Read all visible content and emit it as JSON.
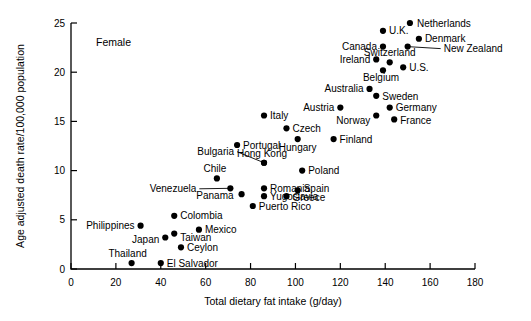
{
  "chart_data": {
    "type": "scatter",
    "title": "",
    "annotation": "Female",
    "xlabel": "Total dietary fat intake (g/day)",
    "ylabel": "Age adjusted death rate/100,000 population",
    "xlim": [
      0,
      180
    ],
    "ylim": [
      0,
      25
    ],
    "xticks": [
      0,
      20,
      40,
      60,
      80,
      100,
      120,
      140,
      160,
      180
    ],
    "yticks": [
      0,
      5,
      10,
      15,
      20,
      25
    ],
    "grid": false,
    "legend": "none",
    "points": [
      {
        "label": "Netherlands",
        "x": 151,
        "y": 25.0,
        "label_dx": 7,
        "label_dy": 3.5,
        "anchor": "start",
        "leader": false
      },
      {
        "label": "U.K.",
        "x": 139,
        "y": 24.2,
        "label_dx": 6,
        "label_dy": 3.5,
        "anchor": "start",
        "leader": false
      },
      {
        "label": "Denmark",
        "x": 155,
        "y": 23.4,
        "label_dx": 6,
        "label_dy": 3.5,
        "anchor": "start",
        "leader": false
      },
      {
        "label": "Canada",
        "x": 139,
        "y": 22.6,
        "label_dx": -6,
        "label_dy": 3.5,
        "anchor": "end",
        "leader": false
      },
      {
        "label": "New Zealand",
        "x": 150,
        "y": 22.6,
        "label_dx": 36,
        "label_dy": 5.0,
        "anchor": "start",
        "leader": true
      },
      {
        "label": "Switzerland",
        "x": 142,
        "y": 21.0,
        "label_dx": 0,
        "label_dy": -6,
        "anchor": "middle",
        "leader": false
      },
      {
        "label": "Ireland",
        "x": 136,
        "y": 21.3,
        "label_dx": -6,
        "label_dy": 3.5,
        "anchor": "end",
        "leader": false
      },
      {
        "label": "U.S.",
        "x": 148,
        "y": 20.5,
        "label_dx": 6,
        "label_dy": 3.5,
        "anchor": "start",
        "leader": false
      },
      {
        "label": "Belgium",
        "x": 139,
        "y": 20.2,
        "label_dx": -2,
        "label_dy": 11,
        "anchor": "middle",
        "leader": false
      },
      {
        "label": "Australia",
        "x": 133,
        "y": 18.3,
        "label_dx": -6,
        "label_dy": 3.5,
        "anchor": "end",
        "leader": false
      },
      {
        "label": "Sweden",
        "x": 136,
        "y": 17.6,
        "label_dx": 6,
        "label_dy": 4.0,
        "anchor": "start",
        "leader": false
      },
      {
        "label": "Germany",
        "x": 142,
        "y": 16.4,
        "label_dx": 6,
        "label_dy": 3.5,
        "anchor": "start",
        "leader": false
      },
      {
        "label": "Austria",
        "x": 120,
        "y": 16.4,
        "label_dx": -6,
        "label_dy": 3.5,
        "anchor": "end",
        "leader": false
      },
      {
        "label": "Norway",
        "x": 136,
        "y": 15.6,
        "label_dx": -6,
        "label_dy": 9.0,
        "anchor": "end",
        "leader": false
      },
      {
        "label": "France",
        "x": 144,
        "y": 15.2,
        "label_dx": 6,
        "label_dy": 5.0,
        "anchor": "start",
        "leader": false
      },
      {
        "label": "Italy",
        "x": 86,
        "y": 15.6,
        "label_dx": 6,
        "label_dy": 3.5,
        "anchor": "start",
        "leader": false
      },
      {
        "label": "Czech",
        "x": 96,
        "y": 14.3,
        "label_dx": 6,
        "label_dy": 3.5,
        "anchor": "start",
        "leader": false
      },
      {
        "label": "Hungary",
        "x": 101,
        "y": 13.2,
        "label_dx": 0,
        "label_dy": 12,
        "anchor": "middle",
        "leader": false
      },
      {
        "label": "Finland",
        "x": 117,
        "y": 13.2,
        "label_dx": 6,
        "label_dy": 3.5,
        "anchor": "start",
        "leader": false
      },
      {
        "label": "Portugal",
        "x": 74,
        "y": 12.6,
        "label_dx": 6,
        "label_dy": 3.5,
        "anchor": "start",
        "leader": false
      },
      {
        "label": "Hong Kong",
        "x": 86,
        "y": 10.8,
        "label_dx": -2,
        "label_dy": -6,
        "anchor": "middle",
        "leader": false
      },
      {
        "label": "Bulgaria",
        "x": 86,
        "y": 10.8,
        "label_dx": -30,
        "label_dy": -8,
        "anchor": "end",
        "leader": true
      },
      {
        "label": "Poland",
        "x": 103,
        "y": 10.0,
        "label_dx": 6,
        "label_dy": 3.5,
        "anchor": "start",
        "leader": false
      },
      {
        "label": "Chile",
        "x": 65,
        "y": 9.2,
        "label_dx": -2,
        "label_dy": -6,
        "anchor": "middle",
        "leader": false
      },
      {
        "label": "Venezuela",
        "x": 71,
        "y": 8.2,
        "label_dx": -34,
        "label_dy": 3.5,
        "anchor": "end",
        "leader": true
      },
      {
        "label": "Romania",
        "x": 86,
        "y": 8.2,
        "label_dx": 6,
        "label_dy": 3.5,
        "anchor": "start",
        "leader": false
      },
      {
        "label": "Spain",
        "x": 101,
        "y": 8.0,
        "label_dx": 6,
        "label_dy": 2.0,
        "anchor": "start",
        "leader": false
      },
      {
        "label": "Panama",
        "x": 76,
        "y": 7.6,
        "label_dx": -8,
        "label_dy": 4.5,
        "anchor": "end",
        "leader": false
      },
      {
        "label": "Yugoslavia",
        "x": 86,
        "y": 7.4,
        "label_dx": 6,
        "label_dy": 4.0,
        "anchor": "start",
        "leader": false
      },
      {
        "label": "Greece",
        "x": 96,
        "y": 7.4,
        "label_dx": 6,
        "label_dy": 5.0,
        "anchor": "start",
        "leader": false
      },
      {
        "label": "Puerto Rico",
        "x": 81,
        "y": 6.4,
        "label_dx": 6,
        "label_dy": 3.5,
        "anchor": "start",
        "leader": false
      },
      {
        "label": "Colombia",
        "x": 46,
        "y": 5.4,
        "label_dx": 6,
        "label_dy": 3.5,
        "anchor": "start",
        "leader": false
      },
      {
        "label": "Philippines",
        "x": 31,
        "y": 4.4,
        "label_dx": -6,
        "label_dy": 3.5,
        "anchor": "end",
        "leader": false
      },
      {
        "label": "Mexico",
        "x": 57,
        "y": 4.0,
        "label_dx": 6,
        "label_dy": 3.5,
        "anchor": "start",
        "leader": false
      },
      {
        "label": "Taiwan",
        "x": 46,
        "y": 3.6,
        "label_dx": 6,
        "label_dy": 7.0,
        "anchor": "start",
        "leader": false
      },
      {
        "label": "Japan",
        "x": 42,
        "y": 3.2,
        "label_dx": -6,
        "label_dy": 5.0,
        "anchor": "end",
        "leader": false
      },
      {
        "label": "Ceylon",
        "x": 49,
        "y": 2.2,
        "label_dx": 6,
        "label_dy": 3.5,
        "anchor": "start",
        "leader": false
      },
      {
        "label": "Thailand",
        "x": 27,
        "y": 0.6,
        "label_dx": -4,
        "label_dy": -6,
        "anchor": "middle",
        "leader": false
      },
      {
        "label": "El Salvador",
        "x": 40,
        "y": 0.6,
        "label_dx": 6,
        "label_dy": 3.5,
        "anchor": "start",
        "leader": false
      }
    ]
  }
}
